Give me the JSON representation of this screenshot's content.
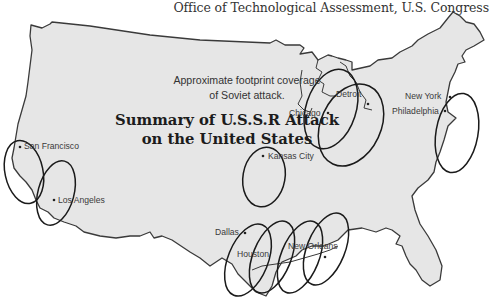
{
  "header": {
    "credit": "Office of Technological Assessment, U.S. Congress"
  },
  "map": {
    "title_line1": "Summary of U.S.S.R Attack",
    "title_line2": "on the United States",
    "subtitle_line1": "Approximate footprint coverage",
    "subtitle_line2": "of Soviet attack.",
    "land_color": "#e6e6e6",
    "outline_color": "#3a3a3a",
    "footprint_color": "#1a1a1a",
    "cities": [
      {
        "name": "San Francisco"
      },
      {
        "name": "Los Angeles"
      },
      {
        "name": "Kansas City"
      },
      {
        "name": "Chicago"
      },
      {
        "name": "Detroit"
      },
      {
        "name": "New York"
      },
      {
        "name": "Philadelphia"
      },
      {
        "name": "Dallas"
      },
      {
        "name": "Houston"
      },
      {
        "name": "New Orleans"
      }
    ]
  }
}
